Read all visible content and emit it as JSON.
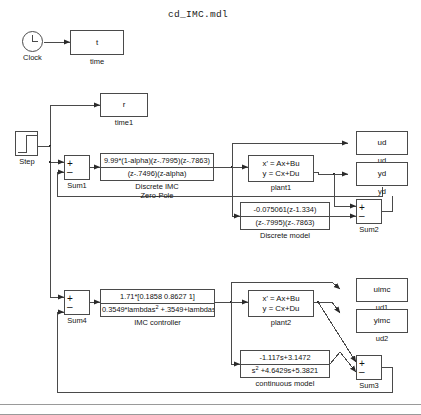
{
  "window": {
    "title": "cd_IMC.mdl"
  },
  "blocks": {
    "clock": {
      "label": "Clock",
      "name": "Clock"
    },
    "time": {
      "text": "t",
      "label": "time"
    },
    "time1": {
      "text": "r",
      "label": "time1"
    },
    "step": {
      "label": "Step"
    },
    "sum1": {
      "plus": "+",
      "minus": "–",
      "label": "Sum1"
    },
    "sum2": {
      "plus": "+",
      "minus": "–",
      "label": "Sum2"
    },
    "sum3": {
      "plus": "+",
      "minus": "–",
      "label": "Sum3"
    },
    "sum4": {
      "plus": "+",
      "minus": "–",
      "label": "Sum4"
    },
    "discrete_imc": {
      "numerator": "9.99*(1-alpha)(z-.7995)(z-.7863)",
      "denominator": "(z-.7496)(z-alpha)",
      "label_line1": "Discrete IMC",
      "label_line2": "Zero-Pole"
    },
    "plant1": {
      "line1": "x' = Ax+Bu",
      "line2": "y = Cx+Du",
      "label": "plant1"
    },
    "plant2": {
      "line1": "x' = Ax+Bu",
      "line2": "y = Cx+Du",
      "label": "plant2"
    },
    "discrete_model": {
      "numerator": "-0.075061(z-1.334)",
      "denominator": "(z-.7995)(z-.7863)",
      "label": "Discrete model"
    },
    "imc_controller": {
      "numerator": "1.71*[0.1858  0.8627  1]",
      "denominator_pre": "0.3549*lambdas",
      "denominator_sup": "2",
      "denominator_post": "  +.3549+lambdas+",
      "label": "IMC controller"
    },
    "continuous_model": {
      "numerator": "-1.117s+3.1472",
      "denominator_pre": "s",
      "denominator_sup": "2",
      "denominator_post": " +4.6429s+5.3821",
      "label": "continuous model"
    },
    "ud": {
      "text": "ud",
      "label": "ud"
    },
    "yd": {
      "text": "yd",
      "label": "yd"
    },
    "uimc": {
      "text": "uimc",
      "label": "ud1"
    },
    "yimc": {
      "text": "yimc",
      "label": "ud2"
    }
  },
  "colors": {
    "stroke": "#4a4a4a",
    "text": "#111111",
    "background": "#ffffff",
    "frame": "#9a9a9a"
  }
}
